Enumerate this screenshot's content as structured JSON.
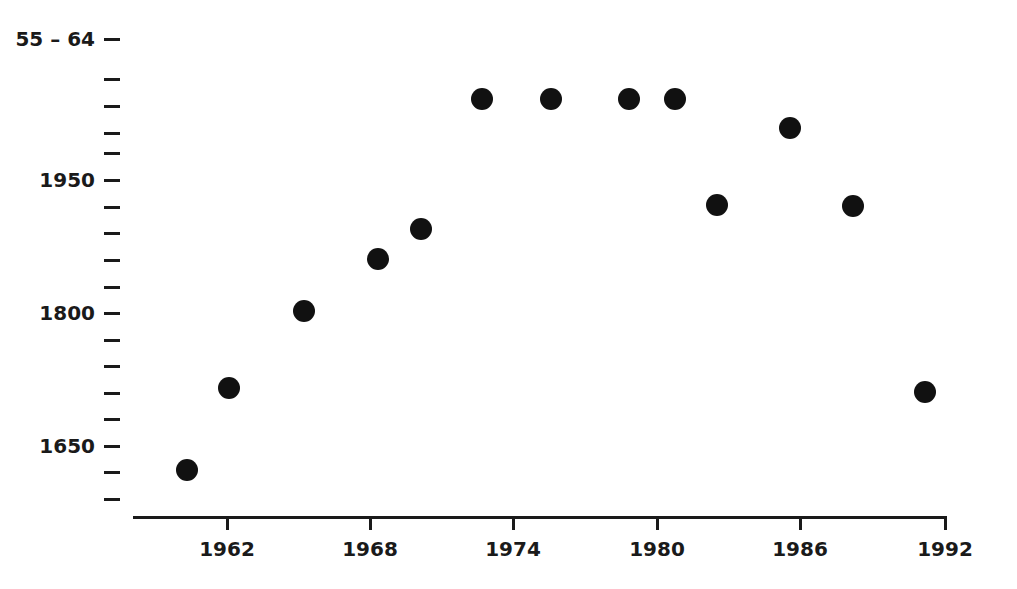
{
  "chart_data": {
    "type": "scatter",
    "title": "55 – 64",
    "xlabel": "",
    "ylabel": "",
    "grid": false,
    "legend": null,
    "marker": {
      "shape": "circle",
      "color": "#111111",
      "size_px": 22
    },
    "xlim": [
      1959.1,
      1992.0
    ],
    "ylim": [
      1596,
      2092
    ],
    "x_ticks": [
      1962,
      1968,
      1974,
      1980,
      1986,
      1992
    ],
    "x_tick_labels": [
      "1962",
      "1968",
      "1974",
      "1980",
      "1986",
      "1992"
    ],
    "y_major_ticks": [
      1950,
      1800,
      1650
    ],
    "y_major_tick_labels": [
      "1950",
      "1800",
      "1650"
    ],
    "y_minor_tick_count_above_1950": 4,
    "y_all_tick_values": [
      2072,
      2042,
      2012,
      1980,
      1950,
      1920,
      1890,
      1860,
      1830,
      1800,
      1770,
      1740,
      1710,
      1680,
      1650,
      1620,
      1590
    ],
    "top_label": "55 – 64",
    "x": [
      1960.3,
      1962.1,
      1965.2,
      1968.3,
      1970.1,
      1972.7,
      1975.5,
      1978.8,
      1980.7,
      1982.5,
      1985.5,
      1988.2,
      1991.2
    ],
    "y": [
      1623,
      1715,
      1802,
      1861,
      1895,
      2041,
      2041,
      2041,
      2041,
      1922,
      2009,
      1921,
      1711
    ],
    "points": [
      {
        "x": 1960.3,
        "y": 1623,
        "px": 187,
        "py": 470
      },
      {
        "x": 1962.1,
        "y": 1715,
        "px": 229,
        "py": 388
      },
      {
        "x": 1965.2,
        "y": 1802,
        "px": 304,
        "py": 311
      },
      {
        "x": 1968.3,
        "y": 1861,
        "px": 378,
        "py": 259
      },
      {
        "x": 1970.1,
        "y": 1895,
        "px": 421,
        "py": 229
      },
      {
        "x": 1972.7,
        "y": 2041,
        "px": 482,
        "py": 99
      },
      {
        "x": 1975.5,
        "y": 2041,
        "px": 551,
        "py": 99
      },
      {
        "x": 1978.8,
        "y": 2041,
        "px": 629,
        "py": 99
      },
      {
        "x": 1980.7,
        "y": 2041,
        "px": 675,
        "py": 99
      },
      {
        "x": 1982.5,
        "y": 1922,
        "px": 717,
        "py": 205
      },
      {
        "x": 1985.5,
        "y": 2009,
        "px": 790,
        "py": 128
      },
      {
        "x": 1988.2,
        "y": 1921,
        "px": 853,
        "py": 206
      },
      {
        "x": 1991.2,
        "y": 1711,
        "px": 925,
        "py": 392
      }
    ]
  },
  "axis_geometry": {
    "x_axis_y_px": 516,
    "x_axis_left_px": 133,
    "x_axis_right_px": 947,
    "y_tick_x_px": 104,
    "x_tick_positions_px": [
      227,
      370,
      513,
      657,
      800,
      945
    ],
    "y_tick_positions_px": [
      {
        "value": 2072,
        "py": 39,
        "major": true,
        "label": "55 – 64"
      },
      {
        "value": 2042,
        "py": 79,
        "major": false,
        "label": ""
      },
      {
        "value": 2012,
        "py": 106,
        "major": false,
        "label": ""
      },
      {
        "value": 1980,
        "py": 133,
        "major": false,
        "label": ""
      },
      {
        "value": 1962,
        "py": 153,
        "major": false,
        "label": ""
      },
      {
        "value": 1950,
        "py": 180,
        "major": true,
        "label": "1950"
      },
      {
        "value": 1920,
        "py": 207,
        "major": false,
        "label": ""
      },
      {
        "value": 1890,
        "py": 233,
        "major": false,
        "label": ""
      },
      {
        "value": 1860,
        "py": 260,
        "major": false,
        "label": ""
      },
      {
        "value": 1830,
        "py": 287,
        "major": false,
        "label": ""
      },
      {
        "value": 1800,
        "py": 313,
        "major": true,
        "label": "1800"
      },
      {
        "value": 1770,
        "py": 340,
        "major": false,
        "label": ""
      },
      {
        "value": 1740,
        "py": 366,
        "major": false,
        "label": ""
      },
      {
        "value": 1710,
        "py": 393,
        "major": false,
        "label": ""
      },
      {
        "value": 1680,
        "py": 419,
        "major": false,
        "label": ""
      },
      {
        "value": 1650,
        "py": 446,
        "major": true,
        "label": "1650"
      },
      {
        "value": 1620,
        "py": 472,
        "major": false,
        "label": ""
      },
      {
        "value": 1590,
        "py": 499,
        "major": false,
        "label": ""
      }
    ]
  }
}
